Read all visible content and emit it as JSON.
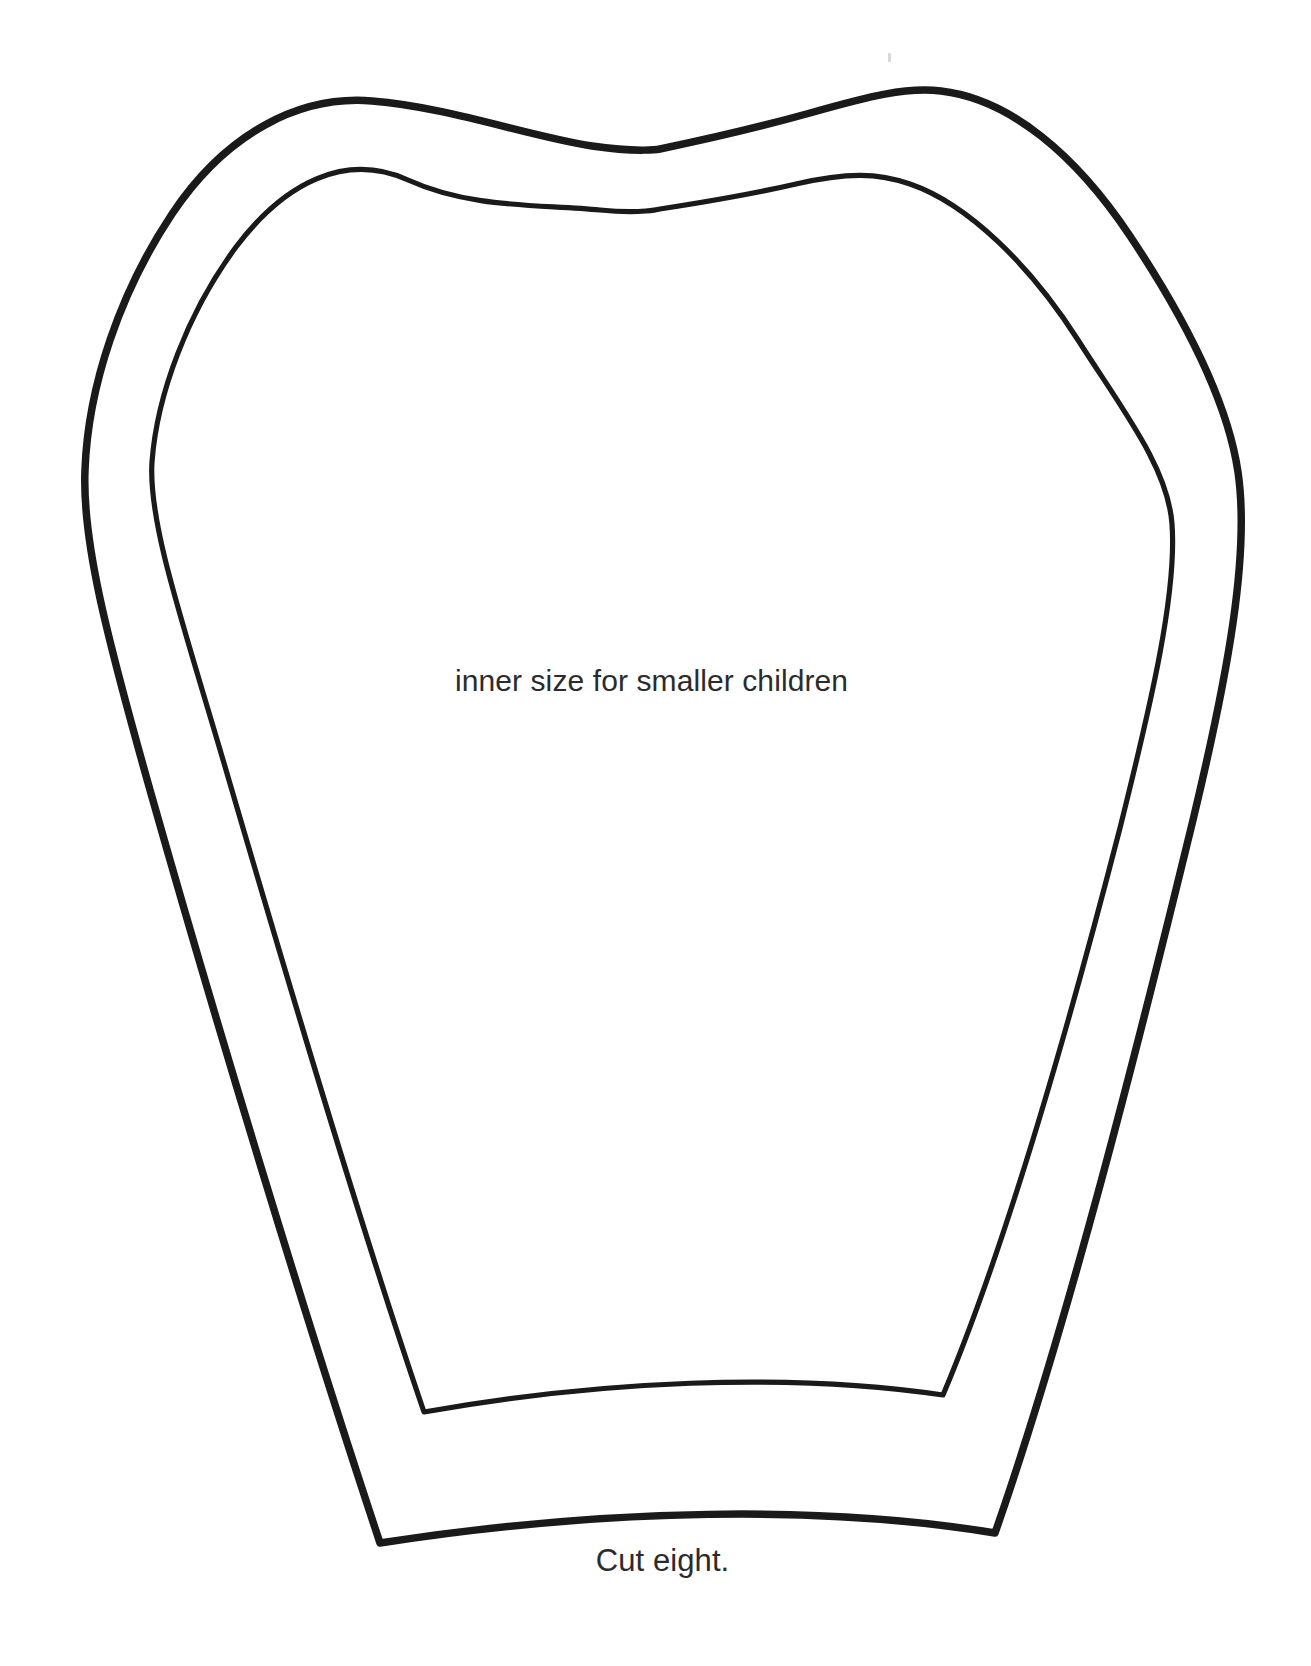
{
  "document": {
    "type": "sewing-pattern-template",
    "title": "Cut eight.",
    "background_color": "#ffffff",
    "ink_color": "#1a1a1a"
  },
  "labels": {
    "inner_size": "inner size for smaller children",
    "cut_count": "Cut eight."
  },
  "shapes": {
    "outer": {
      "name": "outer-cutting-line",
      "description": "outer pattern outline for larger size",
      "stroke_color": "#1a1a1a",
      "stroke_width": 7.5,
      "path": "M 380 1543 C 306 1320 218 1030 150 790 C 106 634 82 540 85 470 C 88 386 120 292 172 214 C 226 133 300 95 372 101 C 448 107 528 136 592 146 C 640 153 660 149 660 149 C 660 149 742 132 810 113 C 870 96 906 87 941 91 C 1010 99 1076 155 1130 236 C 1188 323 1228 404 1238 472 C 1250 554 1228 674 1193 820 C 1140 1038 1068 1324 995 1533 C 826 1505 606 1508 380 1543 Z"
    },
    "inner": {
      "name": "inner-cutting-line",
      "description": "inner pattern outline for smaller children",
      "stroke_color": "#1a1a1a",
      "stroke_width": 5.2,
      "path": "M 424 1412 C 360 1225 286 975 226 770 C 184 626 148 524 152 462 C 157 394 188 312 236 247 C 285 182 346 152 408 180 C 472 209 540 204 600 210 C 642 214 660 209 660 209 C 660 209 744 196 796 184 C 848 172 878 173 910 184 C 968 204 1030 265 1078 340 C 1124 412 1168 468 1172 524 C 1177 592 1152 700 1120 828 C 1072 1014 1008 1241 943 1395 C 787 1372 598 1381 424 1412 Z"
    }
  },
  "artifacts": {
    "scan_speck": "faint-scan-mark"
  }
}
